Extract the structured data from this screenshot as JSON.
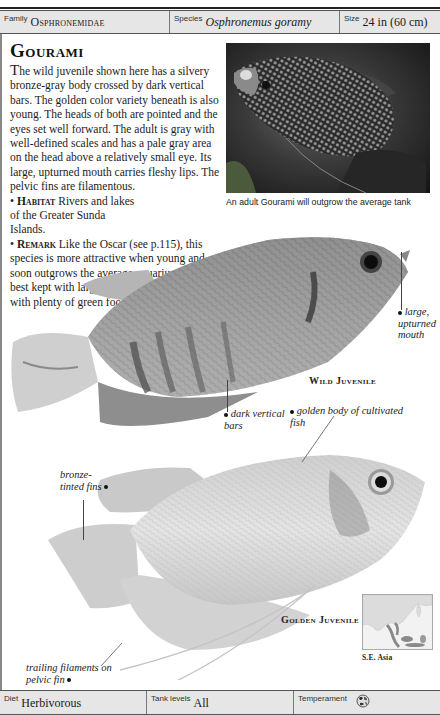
{
  "header": {
    "family": {
      "label": "Family",
      "value": "Osphronemidae"
    },
    "species": {
      "label": "Species",
      "value": "Osphronemus goramy"
    },
    "size": {
      "label": "Size",
      "value": "24 in (60 cm)"
    }
  },
  "title": "Gourami",
  "description": {
    "dropcap": "T",
    "intro": "he wild juvenile shown here has a silvery bronze-gray body crossed by dark vertical bars. The golden color variety beneath is also young. The heads of both are pointed and the eyes set well forward. The adult is gray with well-defined scales and has a pale gray area on the head above a relatively small eye. Its large, upturned mouth carries fleshy lips. The pelvic fins are filamentous.",
    "habitat": {
      "bullet": "•",
      "heading": "Habitat",
      "text": " Rivers and lakes of the Greater Sunda Islands."
    },
    "remark": {
      "bullet": "•",
      "heading": "Remark",
      "text": " Like the Oscar (see p.115), this species is more attractive when young and soon outgrows the average aquarium. It is best kept with large fishes and provided with plenty of green food."
    }
  },
  "photo": {
    "caption": "An adult Gourami will outgrow the average tank"
  },
  "wild_juvenile": {
    "label": "Wild Juvenile",
    "annotations": [
      {
        "id": "mouth",
        "text": "large, upturned mouth"
      },
      {
        "id": "bars",
        "text": "dark vertical bars"
      }
    ]
  },
  "golden_juvenile": {
    "label": "Golden Juvenile",
    "annotations": [
      {
        "id": "body",
        "text": "golden body of cultivated fish"
      },
      {
        "id": "fins",
        "text": "bronze-tinted fins"
      },
      {
        "id": "filaments",
        "text": "trailing filaments on pelvic fin"
      }
    ]
  },
  "map": {
    "label": "S.E. Asia"
  },
  "footer": {
    "diet": {
      "label": "Diet",
      "value": "Herbivorous"
    },
    "tank_levels": {
      "label": "Tank levels",
      "value": "All"
    },
    "temperament": {
      "label": "Temperament",
      "icon": "temperament-mixed-icon"
    }
  },
  "colors": {
    "infobar_bg": "#e6e6e6",
    "rule": "#222222",
    "text": "#1a1a1a"
  }
}
